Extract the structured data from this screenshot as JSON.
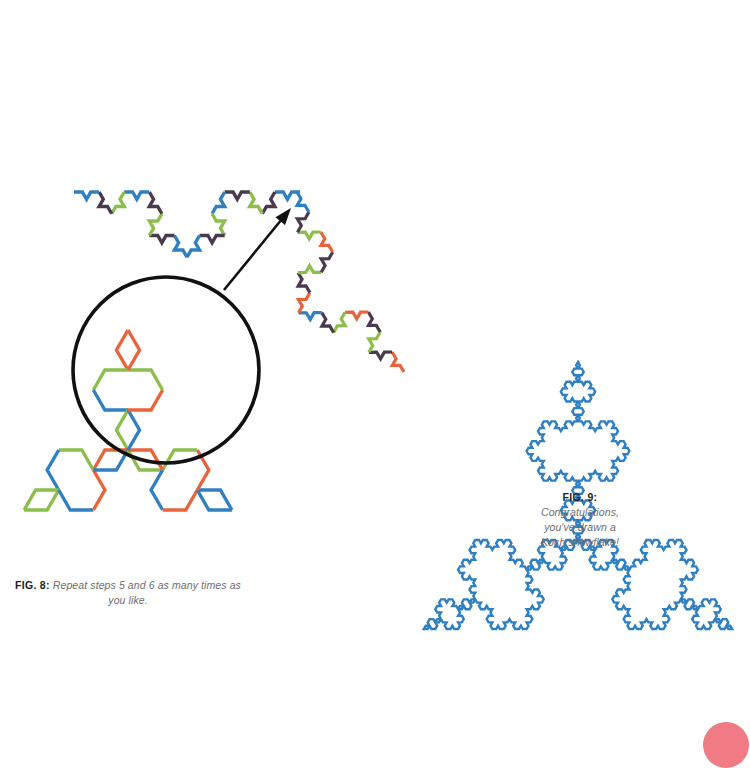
{
  "page": {
    "width": 750,
    "height": 744,
    "background": "#ffffff"
  },
  "palette": {
    "blue": "#2f7fc1",
    "green": "#8cbe4b",
    "orange": "#e9643b",
    "purple": "#4a3a4d",
    "black": "#111111",
    "pink_badge": "#f07b85",
    "caption_label": "#231f20",
    "caption_text": "#6d6e71"
  },
  "figures": {
    "fig8": {
      "label": "FIG. 8:",
      "text_line1": "Repeat steps 5 and 6 as many",
      "text_line2": "times as you like."
    },
    "fig9": {
      "label": "FIG. 9:",
      "text_line1": "Congratulations,",
      "text_line2": "you've drawn a",
      "text_line3": "Koch snowflake!"
    }
  },
  "chart_data": {
    "type": "diagram",
    "shapes": [
      {
        "name": "koch-curve-top-left",
        "kind": "koch-open-curve",
        "iterations": 3,
        "start": [
          74,
          192
        ],
        "end": [
          300,
          192
        ],
        "orientation": "bulge-up",
        "stroke_width": 3.4,
        "segment_colors": [
          "blue",
          "purple",
          "green",
          "purple",
          "blue",
          "green",
          "purple",
          "blue"
        ],
        "description": "Partially magnified Koch curve arc forming the top-left flake edge"
      },
      {
        "name": "koch-curve-middle",
        "kind": "koch-open-curve",
        "iterations": 3,
        "start": [
          297,
          192
        ],
        "end": [
          404,
          372
        ],
        "orientation": "bulge-up-right",
        "stroke_width": 3.2,
        "segment_colors": [
          "orange",
          "purple",
          "green",
          "purple",
          "orange",
          "green",
          "purple",
          "blue"
        ],
        "description": "Second arc of the snowflake continuing clockwise from the first"
      },
      {
        "name": "koch-snowflake-bottom-left",
        "kind": "koch-snowflake",
        "iterations": 2,
        "center": [
          128,
          450
        ],
        "radius": 120,
        "stroke_width": 3.4,
        "segment_colors": [
          "orange",
          "green",
          "blue"
        ],
        "description": "Completed two-iteration Koch snowflake shown under the magnifier"
      },
      {
        "name": "magnifier-circle",
        "kind": "circle",
        "center": [
          166,
          370
        ],
        "radius": 93,
        "stroke": "black",
        "stroke_width": 3.6,
        "description": "Magnifying circle highlighting a region of the snowflake"
      },
      {
        "name": "zoom-arrow",
        "kind": "arrow",
        "from": [
          224,
          290
        ],
        "to": [
          291,
          208
        ],
        "stroke": "black",
        "stroke_width": 2.6,
        "description": "Arrow pointing from the magnified region to the enlarged curve"
      },
      {
        "name": "koch-snowflake-right",
        "kind": "koch-snowflake",
        "iterations": 4,
        "center": [
          578,
          540
        ],
        "radius": 178,
        "stroke": "blue",
        "stroke_width": 2.4,
        "description": "Finished Koch snowflake drawn entirely in blue"
      },
      {
        "name": "page-number-badge",
        "kind": "circle",
        "center": [
          726,
          745
        ],
        "radius": 23,
        "fill": "pink_badge",
        "description": "Pink page-corner badge cropped by the page edge"
      }
    ]
  }
}
